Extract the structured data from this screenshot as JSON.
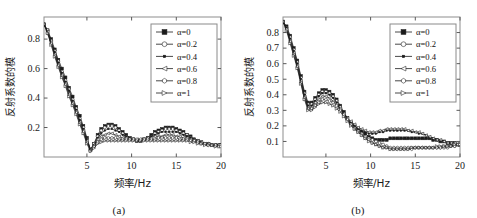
{
  "figure": {
    "background": "#ffffff",
    "panels": [
      "a",
      "b"
    ]
  },
  "panel_a": {
    "caption": "(a)",
    "xlabel": "频率/Hz",
    "ylabel": "反射系数的模",
    "xticks": [
      "5",
      "10",
      "15",
      "20"
    ],
    "yticks": [
      "0.2",
      "0.4",
      "0.6",
      "0.8"
    ],
    "legend_title": "",
    "legend": [
      {
        "label": "α=0",
        "marker": "square-filled"
      },
      {
        "label": "α=0.2",
        "marker": "circle-open"
      },
      {
        "label": "α=0.4",
        "marker": "dot-small"
      },
      {
        "label": "α=0.6",
        "marker": "triangle-left-open"
      },
      {
        "label": "α=0.8",
        "marker": "hexagon-open"
      },
      {
        "label": "α=1",
        "marker": "triangle-right-open"
      }
    ]
  },
  "panel_b": {
    "caption": "(b)",
    "xlabel": "频率/Hz",
    "ylabel": "反射系数的模",
    "xticks": [
      "5",
      "10",
      "15",
      "20"
    ],
    "yticks": [
      "0.1",
      "0.2",
      "0.3",
      "0.4",
      "0.5",
      "0.6",
      "0.7",
      "0.8"
    ],
    "legend_title": "",
    "legend": [
      {
        "label": "α=0",
        "marker": "square-filled"
      },
      {
        "label": "α=0.2",
        "marker": "circle-open"
      },
      {
        "label": "α=0.4",
        "marker": "dot-small"
      },
      {
        "label": "α=0.6",
        "marker": "triangle-left-open"
      },
      {
        "label": "α=0.8",
        "marker": "hexagon-open"
      },
      {
        "label": "α=1",
        "marker": "triangle-right-open"
      }
    ]
  },
  "chart_data": [
    {
      "type": "line",
      "panel": "a",
      "title": "(a)",
      "xlabel": "频率/Hz",
      "ylabel": "反射系数的模",
      "xlim": [
        0.2,
        20
      ],
      "ylim": [
        0.0,
        0.95
      ],
      "xticks": [
        5,
        10,
        15,
        20
      ],
      "yticks": [
        0.2,
        0.4,
        0.6,
        0.8
      ],
      "grid": false,
      "legend_position": "upper-right",
      "x": [
        0.2,
        0.6,
        1.0,
        1.4,
        1.8,
        2.2,
        2.6,
        3.0,
        3.4,
        3.8,
        4.2,
        4.6,
        5.0,
        5.4,
        5.8,
        6.2,
        6.6,
        7.0,
        7.4,
        7.8,
        8.2,
        8.6,
        9.0,
        9.4,
        9.8,
        10.2,
        10.6,
        11.0,
        11.4,
        11.8,
        12.2,
        12.6,
        13.0,
        13.4,
        13.8,
        14.2,
        14.6,
        15.0,
        15.4,
        15.8,
        16.2,
        16.6,
        17.0,
        17.4,
        17.8,
        18.2,
        18.6,
        19.0,
        19.4,
        19.8,
        20.0
      ],
      "series": [
        {
          "name": "α=0",
          "marker": "square-filled",
          "values": [
            0.9,
            0.86,
            0.8,
            0.73,
            0.66,
            0.6,
            0.54,
            0.47,
            0.41,
            0.34,
            0.28,
            0.21,
            0.13,
            0.05,
            0.09,
            0.15,
            0.19,
            0.21,
            0.22,
            0.22,
            0.21,
            0.19,
            0.17,
            0.15,
            0.13,
            0.12,
            0.11,
            0.11,
            0.12,
            0.13,
            0.15,
            0.17,
            0.18,
            0.19,
            0.2,
            0.2,
            0.2,
            0.19,
            0.18,
            0.17,
            0.15,
            0.14,
            0.12,
            0.11,
            0.1,
            0.09,
            0.09,
            0.08,
            0.08,
            0.08,
            0.08
          ]
        },
        {
          "name": "α=0.2",
          "marker": "circle-open",
          "values": [
            0.9,
            0.86,
            0.79,
            0.72,
            0.65,
            0.58,
            0.52,
            0.46,
            0.39,
            0.33,
            0.26,
            0.2,
            0.12,
            0.05,
            0.09,
            0.14,
            0.18,
            0.2,
            0.21,
            0.21,
            0.2,
            0.18,
            0.16,
            0.14,
            0.13,
            0.12,
            0.11,
            0.11,
            0.12,
            0.13,
            0.14,
            0.16,
            0.17,
            0.18,
            0.19,
            0.19,
            0.19,
            0.18,
            0.17,
            0.16,
            0.15,
            0.13,
            0.12,
            0.11,
            0.1,
            0.09,
            0.09,
            0.08,
            0.08,
            0.08,
            0.08
          ]
        },
        {
          "name": "α=0.4",
          "marker": "dot-small",
          "values": [
            0.9,
            0.85,
            0.78,
            0.71,
            0.64,
            0.57,
            0.51,
            0.45,
            0.38,
            0.32,
            0.25,
            0.19,
            0.12,
            0.05,
            0.08,
            0.13,
            0.16,
            0.18,
            0.19,
            0.19,
            0.18,
            0.17,
            0.15,
            0.14,
            0.13,
            0.12,
            0.11,
            0.11,
            0.12,
            0.13,
            0.14,
            0.15,
            0.16,
            0.17,
            0.17,
            0.17,
            0.17,
            0.17,
            0.16,
            0.15,
            0.14,
            0.13,
            0.12,
            0.11,
            0.1,
            0.09,
            0.09,
            0.08,
            0.08,
            0.08,
            0.08
          ]
        },
        {
          "name": "α=0.6",
          "marker": "triangle-left-open",
          "values": [
            0.9,
            0.85,
            0.78,
            0.7,
            0.63,
            0.56,
            0.5,
            0.43,
            0.37,
            0.31,
            0.24,
            0.18,
            0.11,
            0.05,
            0.08,
            0.12,
            0.14,
            0.15,
            0.16,
            0.16,
            0.15,
            0.14,
            0.13,
            0.13,
            0.12,
            0.12,
            0.12,
            0.12,
            0.12,
            0.13,
            0.13,
            0.14,
            0.14,
            0.14,
            0.15,
            0.15,
            0.15,
            0.14,
            0.14,
            0.13,
            0.13,
            0.12,
            0.11,
            0.11,
            0.1,
            0.09,
            0.09,
            0.08,
            0.08,
            0.08,
            0.08
          ]
        },
        {
          "name": "α=0.8",
          "marker": "hexagon-open",
          "values": [
            0.9,
            0.84,
            0.77,
            0.69,
            0.62,
            0.55,
            0.49,
            0.42,
            0.36,
            0.3,
            0.23,
            0.17,
            0.1,
            0.04,
            0.07,
            0.1,
            0.12,
            0.13,
            0.13,
            0.13,
            0.13,
            0.12,
            0.12,
            0.12,
            0.12,
            0.12,
            0.12,
            0.12,
            0.12,
            0.12,
            0.12,
            0.12,
            0.13,
            0.13,
            0.13,
            0.13,
            0.13,
            0.13,
            0.12,
            0.12,
            0.12,
            0.11,
            0.11,
            0.1,
            0.09,
            0.09,
            0.08,
            0.08,
            0.08,
            0.08,
            0.08
          ]
        },
        {
          "name": "α=1",
          "marker": "triangle-right-open",
          "values": [
            0.9,
            0.84,
            0.76,
            0.68,
            0.61,
            0.54,
            0.48,
            0.41,
            0.35,
            0.29,
            0.22,
            0.16,
            0.09,
            0.04,
            0.06,
            0.09,
            0.1,
            0.11,
            0.11,
            0.11,
            0.11,
            0.11,
            0.11,
            0.11,
            0.11,
            0.11,
            0.11,
            0.11,
            0.11,
            0.11,
            0.11,
            0.11,
            0.11,
            0.11,
            0.11,
            0.11,
            0.11,
            0.11,
            0.11,
            0.11,
            0.11,
            0.1,
            0.1,
            0.09,
            0.09,
            0.08,
            0.08,
            0.08,
            0.07,
            0.07,
            0.07
          ]
        }
      ]
    },
    {
      "type": "line",
      "panel": "b",
      "title": "(b)",
      "xlabel": "频率/Hz",
      "ylabel": "反射系数的模",
      "xlim": [
        0.2,
        20
      ],
      "ylim": [
        0.0,
        0.9
      ],
      "xticks": [
        5,
        10,
        15,
        20
      ],
      "yticks": [
        0.1,
        0.2,
        0.3,
        0.4,
        0.5,
        0.6,
        0.7,
        0.8
      ],
      "grid": false,
      "legend_position": "upper-right",
      "x": [
        0.2,
        0.6,
        1.0,
        1.4,
        1.8,
        2.2,
        2.6,
        3.0,
        3.4,
        3.8,
        4.2,
        4.6,
        5.0,
        5.4,
        5.8,
        6.2,
        6.6,
        7.0,
        7.4,
        7.8,
        8.2,
        8.6,
        9.0,
        9.4,
        9.8,
        10.2,
        10.6,
        11.0,
        11.4,
        11.8,
        12.2,
        12.6,
        13.0,
        13.4,
        13.8,
        14.2,
        14.6,
        15.0,
        15.4,
        15.8,
        16.2,
        16.6,
        17.0,
        17.4,
        17.8,
        18.2,
        18.6,
        19.0,
        19.4,
        19.8,
        20.0
      ],
      "series": [
        {
          "name": "α=0",
          "marker": "square-filled",
          "values": [
            0.87,
            0.84,
            0.78,
            0.7,
            0.62,
            0.52,
            0.42,
            0.35,
            0.35,
            0.38,
            0.41,
            0.43,
            0.43,
            0.42,
            0.4,
            0.37,
            0.33,
            0.29,
            0.25,
            0.22,
            0.2,
            0.18,
            0.16,
            0.15,
            0.13,
            0.12,
            0.11,
            0.11,
            0.11,
            0.11,
            0.12,
            0.12,
            0.12,
            0.12,
            0.12,
            0.12,
            0.12,
            0.12,
            0.12,
            0.12,
            0.12,
            0.12,
            0.11,
            0.11,
            0.1,
            0.1,
            0.09,
            0.09,
            0.09,
            0.08,
            0.08
          ]
        },
        {
          "name": "α=0.2",
          "marker": "circle-open",
          "values": [
            0.87,
            0.83,
            0.77,
            0.69,
            0.61,
            0.51,
            0.41,
            0.34,
            0.34,
            0.37,
            0.4,
            0.42,
            0.42,
            0.41,
            0.39,
            0.36,
            0.32,
            0.28,
            0.24,
            0.21,
            0.19,
            0.17,
            0.15,
            0.13,
            0.12,
            0.11,
            0.1,
            0.09,
            0.08,
            0.07,
            0.06,
            0.06,
            0.06,
            0.06,
            0.06,
            0.06,
            0.06,
            0.06,
            0.06,
            0.06,
            0.06,
            0.06,
            0.06,
            0.06,
            0.06,
            0.06,
            0.06,
            0.07,
            0.07,
            0.08,
            0.08
          ]
        },
        {
          "name": "α=0.4",
          "marker": "dot-small",
          "values": [
            0.87,
            0.83,
            0.76,
            0.68,
            0.6,
            0.5,
            0.4,
            0.33,
            0.33,
            0.36,
            0.39,
            0.41,
            0.41,
            0.4,
            0.38,
            0.35,
            0.31,
            0.28,
            0.25,
            0.22,
            0.2,
            0.18,
            0.17,
            0.16,
            0.15,
            0.15,
            0.15,
            0.16,
            0.16,
            0.17,
            0.17,
            0.17,
            0.17,
            0.17,
            0.17,
            0.17,
            0.16,
            0.16,
            0.15,
            0.15,
            0.14,
            0.13,
            0.12,
            0.11,
            0.11,
            0.1,
            0.09,
            0.09,
            0.08,
            0.08,
            0.08
          ]
        },
        {
          "name": "α=0.6",
          "marker": "triangle-left-open",
          "values": [
            0.87,
            0.82,
            0.75,
            0.67,
            0.59,
            0.49,
            0.39,
            0.32,
            0.32,
            0.35,
            0.37,
            0.39,
            0.39,
            0.38,
            0.36,
            0.34,
            0.31,
            0.28,
            0.25,
            0.23,
            0.21,
            0.19,
            0.18,
            0.17,
            0.16,
            0.16,
            0.16,
            0.17,
            0.17,
            0.18,
            0.18,
            0.18,
            0.18,
            0.18,
            0.18,
            0.17,
            0.17,
            0.16,
            0.16,
            0.15,
            0.14,
            0.13,
            0.12,
            0.11,
            0.11,
            0.1,
            0.09,
            0.09,
            0.09,
            0.08,
            0.08
          ]
        },
        {
          "name": "α=0.8",
          "marker": "hexagon-open",
          "values": [
            0.87,
            0.82,
            0.74,
            0.66,
            0.58,
            0.48,
            0.38,
            0.31,
            0.31,
            0.33,
            0.35,
            0.37,
            0.37,
            0.36,
            0.35,
            0.33,
            0.3,
            0.27,
            0.24,
            0.21,
            0.18,
            0.16,
            0.14,
            0.12,
            0.11,
            0.09,
            0.08,
            0.07,
            0.06,
            0.06,
            0.05,
            0.05,
            0.05,
            0.05,
            0.05,
            0.05,
            0.05,
            0.06,
            0.06,
            0.06,
            0.06,
            0.06,
            0.06,
            0.06,
            0.06,
            0.07,
            0.07,
            0.07,
            0.07,
            0.08,
            0.08
          ]
        },
        {
          "name": "α=1",
          "marker": "triangle-right-open",
          "values": [
            0.87,
            0.81,
            0.73,
            0.65,
            0.57,
            0.47,
            0.37,
            0.3,
            0.3,
            0.32,
            0.34,
            0.35,
            0.35,
            0.34,
            0.33,
            0.31,
            0.29,
            0.26,
            0.23,
            0.2,
            0.18,
            0.16,
            0.14,
            0.12,
            0.1,
            0.09,
            0.08,
            0.07,
            0.06,
            0.06,
            0.05,
            0.05,
            0.05,
            0.05,
            0.05,
            0.05,
            0.06,
            0.06,
            0.06,
            0.06,
            0.06,
            0.06,
            0.06,
            0.07,
            0.07,
            0.07,
            0.07,
            0.07,
            0.08,
            0.08,
            0.08
          ]
        }
      ]
    }
  ]
}
